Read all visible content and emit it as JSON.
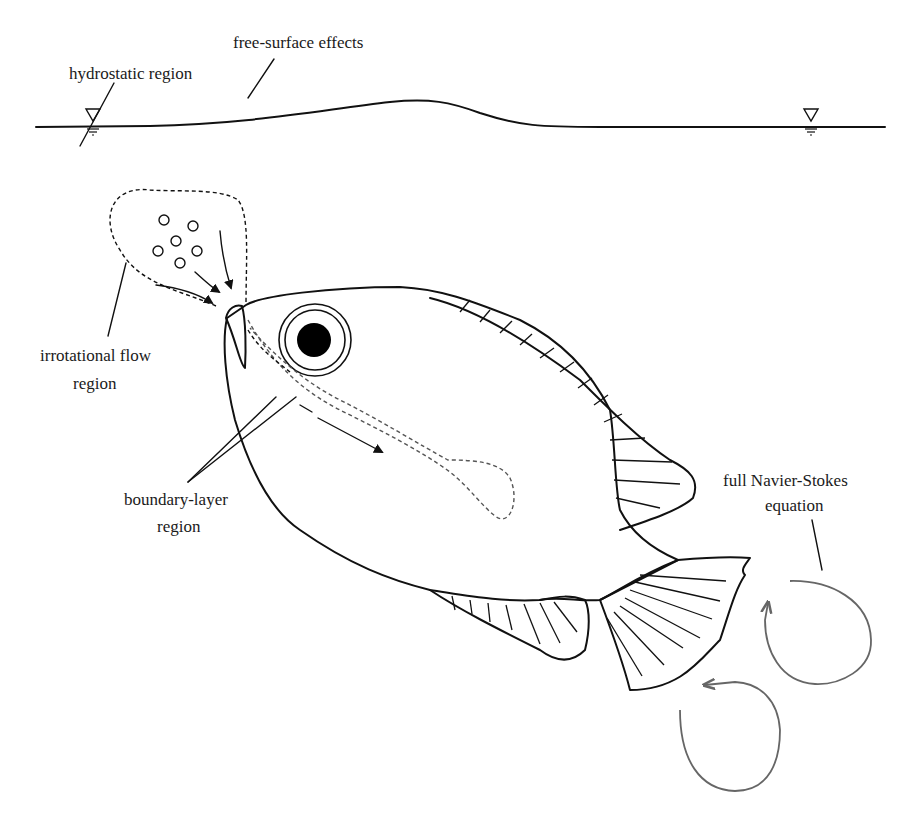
{
  "diagram": {
    "labels": {
      "free_surface": "free-surface effects",
      "hydrostatic": "hydrostatic region",
      "irrotational_line1": "irrotational flow",
      "irrotational_line2": "region",
      "boundary_line1": "boundary-layer",
      "boundary_line2": "region",
      "navier_line1": "full Navier-Stokes",
      "navier_line2": "equation"
    },
    "symbols": {
      "water_level_left": "water-level-marker",
      "water_level_right": "water-level-marker"
    },
    "colors": {
      "ink": "#111111",
      "vortex": "#666666",
      "background": "#ffffff"
    }
  }
}
